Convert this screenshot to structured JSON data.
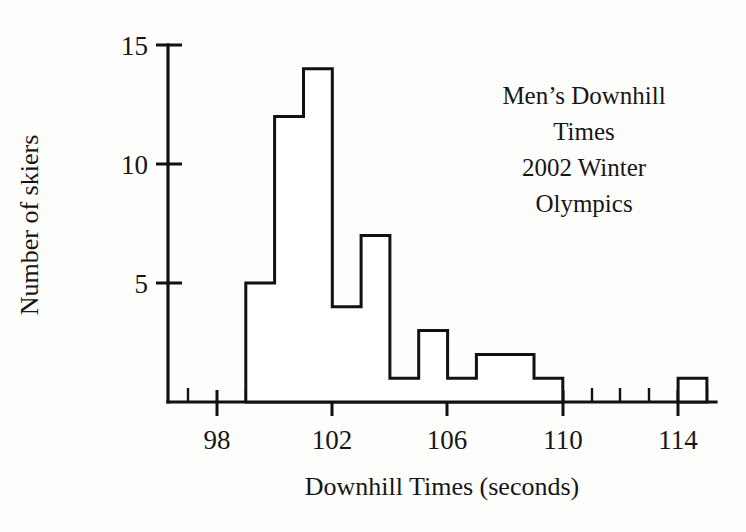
{
  "chart_data": {
    "type": "bar",
    "title": "Men’s Downhill Times 2002 Winter Olympics",
    "title_lines": [
      "Men’s Downhill",
      "Times",
      "2002 Winter",
      "Olympics"
    ],
    "xlabel": "Downhill Times (seconds)",
    "ylabel": "Number of skiers",
    "bin_width": 1,
    "categories": [
      "99",
      "100",
      "101",
      "102",
      "103",
      "104",
      "105",
      "106",
      "107",
      "108",
      "109",
      "114"
    ],
    "bin_starts": [
      99,
      100,
      101,
      102,
      103,
      104,
      105,
      106,
      107,
      108,
      109,
      114
    ],
    "values": [
      5,
      12,
      14,
      4,
      7,
      1,
      3,
      1,
      2,
      2,
      1,
      1
    ],
    "xlim": [
      97,
      116
    ],
    "ylim": [
      0,
      16
    ],
    "xticks": [
      98,
      102,
      106,
      110,
      114
    ],
    "xtick_labels": [
      "98",
      "102",
      "106",
      "110",
      "114"
    ],
    "xticks_minor": [
      97,
      99,
      100,
      101,
      103,
      104,
      105,
      107,
      108,
      109,
      111,
      112,
      113,
      115,
      116
    ],
    "yticks": [
      5,
      10,
      15
    ],
    "ytick_labels": [
      "5",
      "10",
      "15"
    ],
    "grid": false,
    "legend": "none",
    "bar_fill": "#ffffff",
    "bar_stroke": "#111111",
    "axis_color": "#111111",
    "background": "#fdfdfc"
  }
}
